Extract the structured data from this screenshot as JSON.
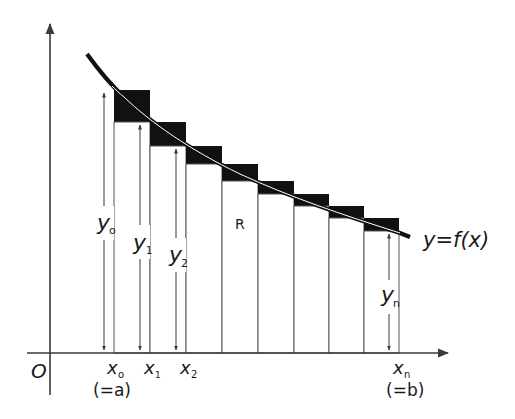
{
  "diagram": {
    "type": "riemann-sum-upper-rectangles",
    "colors": {
      "background": "#ffffff",
      "stroke": "#3a3a3a",
      "fill_excess": "#111111",
      "curve": "#111111"
    },
    "origin_label": "O",
    "curve_label": "y=f(x)",
    "region_label": "R",
    "x_labels": [
      {
        "name": "x0",
        "main": "x",
        "sub": "o",
        "note": "(=a)"
      },
      {
        "name": "x1",
        "main": "x",
        "sub": "1"
      },
      {
        "name": "x2",
        "main": "x",
        "sub": "2"
      },
      {
        "name": "xn",
        "main": "x",
        "sub": "n",
        "note": "(=b)"
      }
    ],
    "y_labels": [
      {
        "name": "y0",
        "main": "y",
        "sub": "o"
      },
      {
        "name": "y1",
        "main": "y",
        "sub": "1"
      },
      {
        "name": "y2",
        "main": "y",
        "sub": "2"
      },
      {
        "name": "yn",
        "main": "y",
        "sub": "n"
      }
    ],
    "rectangles": [
      {
        "x0": 114,
        "x1": 150,
        "top": 90,
        "inner_top": 122
      },
      {
        "x0": 150,
        "x1": 186,
        "top": 122,
        "inner_top": 146
      },
      {
        "x0": 186,
        "x1": 222,
        "top": 146,
        "inner_top": 164
      },
      {
        "x0": 222,
        "x1": 258,
        "top": 164,
        "inner_top": 181
      },
      {
        "x0": 258,
        "x1": 294,
        "top": 181,
        "inner_top": 194
      },
      {
        "x0": 294,
        "x1": 329,
        "top": 194,
        "inner_top": 206
      },
      {
        "x0": 329,
        "x1": 364,
        "top": 206,
        "inner_top": 218
      },
      {
        "x0": 364,
        "x1": 399,
        "top": 218,
        "inner_top": 231
      }
    ]
  }
}
